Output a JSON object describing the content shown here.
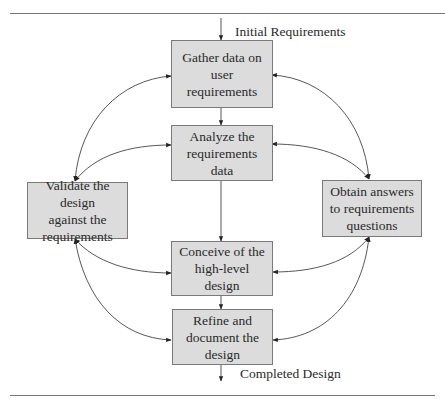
{
  "diagram": {
    "type": "process-flow",
    "input_label": "Initial Requirements",
    "output_label": "Completed Design",
    "colors": {
      "box_fill": "#dcdcdc",
      "box_border": "#7a7a7a",
      "line": "#333333",
      "rule": "#777777"
    },
    "nodes": [
      {
        "id": "gather",
        "lines": [
          "Gather data on",
          "user requirements"
        ]
      },
      {
        "id": "analyze",
        "lines": [
          "Analyze the",
          "requirements data"
        ]
      },
      {
        "id": "conceive",
        "lines": [
          "Conceive of the",
          "high-level design"
        ]
      },
      {
        "id": "refine",
        "lines": [
          "Refine and",
          "document the",
          "design"
        ]
      },
      {
        "id": "validate",
        "lines": [
          "Validate the design",
          "against the",
          "requirements"
        ]
      },
      {
        "id": "obtain",
        "lines": [
          "Obtain answers",
          "to requirements",
          "questions"
        ]
      }
    ],
    "edges": [
      {
        "from": "input",
        "to": "gather",
        "type": "one-way"
      },
      {
        "from": "gather",
        "to": "analyze",
        "type": "one-way"
      },
      {
        "from": "analyze",
        "to": "conceive",
        "type": "one-way"
      },
      {
        "from": "conceive",
        "to": "refine",
        "type": "one-way"
      },
      {
        "from": "refine",
        "to": "output",
        "type": "one-way"
      },
      {
        "from": "validate",
        "to": "gather",
        "type": "two-way"
      },
      {
        "from": "validate",
        "to": "analyze",
        "type": "two-way"
      },
      {
        "from": "validate",
        "to": "conceive",
        "type": "two-way"
      },
      {
        "from": "validate",
        "to": "refine",
        "type": "two-way"
      },
      {
        "from": "obtain",
        "to": "gather",
        "type": "two-way"
      },
      {
        "from": "obtain",
        "to": "analyze",
        "type": "two-way"
      },
      {
        "from": "obtain",
        "to": "conceive",
        "type": "two-way"
      },
      {
        "from": "obtain",
        "to": "refine",
        "type": "two-way"
      }
    ]
  }
}
